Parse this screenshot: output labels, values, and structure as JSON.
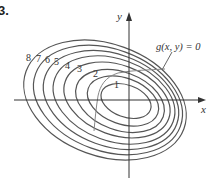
{
  "problem_number": "3.",
  "axes": {
    "x_label": "x",
    "y_label": "y",
    "origin": [
      129,
      100
    ],
    "x_axis": {
      "from": [
        14,
        100
      ],
      "to": [
        206,
        100
      ]
    },
    "y_axis": {
      "from": [
        129,
        178
      ],
      "to": [
        129,
        12
      ]
    }
  },
  "constraint_label": "g(x, y) = 0",
  "colors": {
    "contour": "#555555",
    "constraint": "#888888",
    "axis": "#333333",
    "text": "#333333"
  },
  "contours": [
    {
      "level": "1",
      "cx": 126,
      "cy": 101,
      "rx": 26,
      "ry": 16,
      "label_pos": [
        114,
        88
      ]
    },
    {
      "level": "2",
      "cx": 123,
      "cy": 101,
      "rx": 37,
      "ry": 23,
      "label_pos": [
        93,
        77
      ]
    },
    {
      "level": "3",
      "cx": 120,
      "cy": 101,
      "rx": 46,
      "ry": 29,
      "label_pos": [
        77,
        72
      ]
    },
    {
      "level": "4",
      "cx": 117,
      "cy": 100,
      "rx": 55,
      "ry": 35,
      "label_pos": [
        65,
        69
      ]
    },
    {
      "level": "5",
      "cx": 114,
      "cy": 100,
      "rx": 63,
      "ry": 41,
      "label_pos": [
        54,
        65
      ]
    },
    {
      "level": "6",
      "cx": 111,
      "cy": 100,
      "rx": 70,
      "ry": 46,
      "label_pos": [
        45,
        63
      ]
    },
    {
      "level": "7",
      "cx": 108,
      "cy": 100,
      "rx": 77,
      "ry": 51,
      "label_pos": [
        36,
        62
      ]
    },
    {
      "level": "8",
      "cx": 105,
      "cy": 100,
      "rx": 84,
      "ry": 56,
      "label_pos": [
        26,
        61
      ]
    }
  ],
  "rotation_deg": 20
}
